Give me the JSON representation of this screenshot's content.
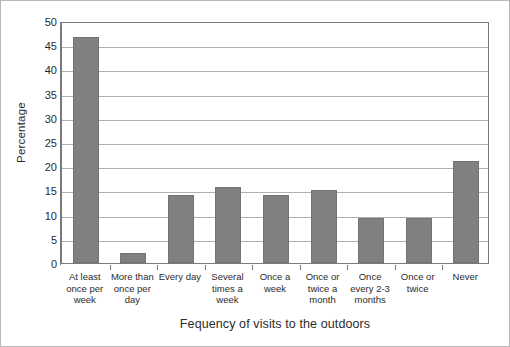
{
  "chart_data": {
    "type": "bar",
    "title": "",
    "xlabel": "Fequency of visits to the outdoors",
    "ylabel": "Percentage",
    "categories": [
      "At least once per week",
      "More than once per day",
      "Every day",
      "Several times a week",
      "Once a week",
      "Once or twice a month",
      "Once every 2-3 months",
      "Once or twice",
      "Never"
    ],
    "category_lines": [
      [
        "At least",
        "once per",
        "week"
      ],
      [
        "More than",
        "once per",
        "day"
      ],
      [
        "Every day"
      ],
      [
        "Several",
        "times a",
        "week"
      ],
      [
        "Once a",
        "week"
      ],
      [
        "Once or",
        "twice a",
        "month"
      ],
      [
        "Once",
        "every 2-3",
        "months"
      ],
      [
        "Once or",
        "twice"
      ],
      [
        "Never"
      ]
    ],
    "values": [
      46.8,
      2.0,
      14.0,
      15.8,
      14.0,
      15.0,
      9.2,
      9.2,
      21.0
    ],
    "ylim": [
      0,
      50
    ],
    "yticks": [
      0,
      5,
      10,
      15,
      20,
      25,
      30,
      35,
      40,
      45,
      50
    ],
    "ytick_labels": [
      "0",
      "5",
      "10",
      "15",
      "20",
      "25",
      "30",
      "35",
      "40",
      "45",
      "50"
    ],
    "grid": true,
    "legend": null,
    "bar_color": "#808080",
    "grid_color": "#b0b0b0",
    "axis_color": "#7a7a7a"
  }
}
